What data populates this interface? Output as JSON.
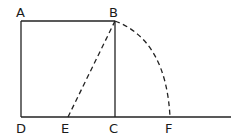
{
  "diagram": {
    "points": {
      "A": {
        "label": "A",
        "x": 21,
        "y": 21
      },
      "B": {
        "label": "B",
        "x": 115,
        "y": 21
      },
      "C": {
        "label": "C",
        "x": 115,
        "y": 117
      },
      "D": {
        "label": "D",
        "x": 21,
        "y": 117
      },
      "E": {
        "label": "E",
        "x": 68,
        "y": 117
      },
      "F": {
        "label": "F",
        "x": 170,
        "y": 117
      }
    },
    "segments": [
      {
        "from": "A",
        "to": "B",
        "style": "solid"
      },
      {
        "from": "A",
        "to": "D",
        "style": "solid"
      },
      {
        "from": "B",
        "to": "C",
        "style": "solid"
      },
      {
        "from": "D",
        "to": "F",
        "style": "solid",
        "extends_to_x": 231
      },
      {
        "from": "E",
        "to": "B",
        "style": "dashed"
      }
    ],
    "arcs": [
      {
        "center": "E",
        "from": "B",
        "to": "F",
        "style": "dashed"
      }
    ],
    "colors": {
      "stroke": "#222222",
      "background": "#ffffff"
    }
  }
}
